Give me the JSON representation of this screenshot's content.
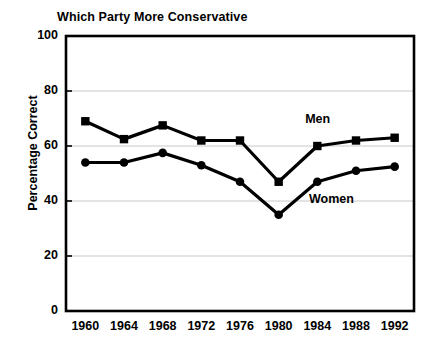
{
  "chart_data": {
    "type": "line",
    "title": "Which Party More Conservative",
    "xlabel": "",
    "ylabel": "Percentage Correct",
    "categories": [
      "1960",
      "1964",
      "1968",
      "1972",
      "1976",
      "1980",
      "1984",
      "1988",
      "1992"
    ],
    "x": [
      1960,
      1964,
      1968,
      1972,
      1976,
      1980,
      1984,
      1988,
      1992
    ],
    "ylim": [
      0,
      100
    ],
    "yticks": [
      0,
      20,
      40,
      60,
      80,
      100
    ],
    "ytick_labels": [
      "0",
      "20",
      "40",
      "60",
      "80",
      "100"
    ],
    "grid": "horizontal",
    "legend_position": "inline-annotations",
    "series": [
      {
        "name": "Men",
        "marker": "square",
        "color": "#000000",
        "values": [
          69,
          62.5,
          67.5,
          62,
          62,
          47,
          60,
          62,
          63
        ]
      },
      {
        "name": "Women",
        "marker": "circle",
        "color": "#000000",
        "values": [
          54,
          54,
          57.5,
          53,
          47,
          35,
          47,
          51,
          52.5
        ]
      }
    ],
    "annotations": [
      {
        "text": "Men",
        "series": "Men"
      },
      {
        "text": "Women",
        "series": "Women"
      }
    ]
  },
  "colors": {
    "line": "#000000",
    "axis": "#000000",
    "grid": "#c8c8c8",
    "background": "#ffffff"
  }
}
